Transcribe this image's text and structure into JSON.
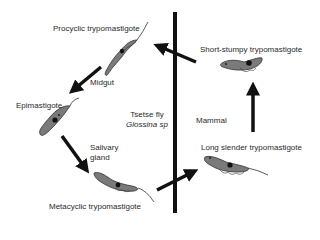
{
  "diagram": {
    "colors": {
      "line": "#111111",
      "cell_fill": "#7a7a7a",
      "cell_outline": "#333333",
      "nucleus": "#111111",
      "text": "#2a2a2a"
    },
    "divider": {
      "orientation": "vertical"
    },
    "hosts": {
      "left": {
        "line1": "Tsetse fly",
        "line2": "Glossina sp"
      },
      "right": {
        "label": "Mammal"
      }
    },
    "stages": [
      {
        "id": "procyclic",
        "label": "Procyclic trypomastigote"
      },
      {
        "id": "epimastigote",
        "label": "Epimastigote"
      },
      {
        "id": "metacyclic",
        "label": "Metacyclic trypomastigote"
      },
      {
        "id": "long-slender",
        "label": "Long slender trypomastigote"
      },
      {
        "id": "short-stumpy",
        "label": "Short-stumpy trypomastigote"
      }
    ],
    "locations": [
      {
        "id": "midgut",
        "label": "Midgut"
      },
      {
        "id": "salivary-gland",
        "line1": "Salivary",
        "line2": "gland"
      }
    ],
    "transitions": [
      {
        "from": "short-stumpy",
        "to": "procyclic"
      },
      {
        "from": "procyclic",
        "to": "epimastigote"
      },
      {
        "from": "epimastigote",
        "to": "metacyclic"
      },
      {
        "from": "metacyclic",
        "to": "long-slender"
      },
      {
        "from": "long-slender",
        "to": "short-stumpy"
      }
    ]
  }
}
